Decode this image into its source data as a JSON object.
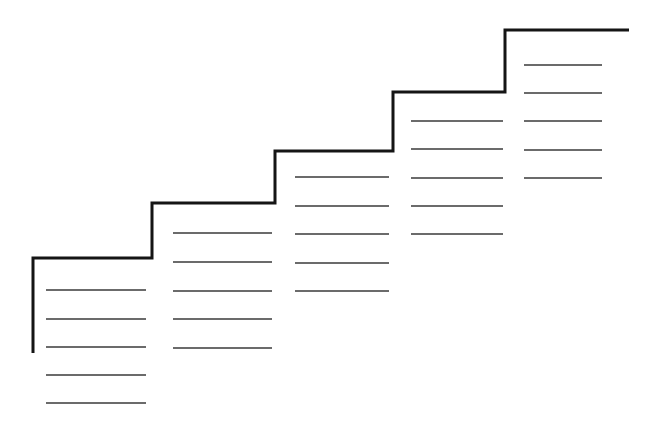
{
  "diagram": {
    "type": "staircase-worksheet",
    "colors": {
      "background": "#ffffff",
      "staircase": "#151515",
      "lines": "#3a3a3a"
    },
    "staircase_points": [
      [
        33,
        353
      ],
      [
        33,
        258
      ],
      [
        152,
        258
      ],
      [
        152,
        203
      ],
      [
        275,
        203
      ],
      [
        275,
        151
      ],
      [
        393,
        151
      ],
      [
        393,
        92
      ],
      [
        505,
        92
      ],
      [
        505,
        30
      ],
      [
        629,
        30
      ]
    ],
    "steps": [
      {
        "name": "step-1",
        "line_x1": 46,
        "line_x2": 146,
        "lines_y": [
          290,
          319,
          347,
          375,
          403
        ]
      },
      {
        "name": "step-2",
        "line_x1": 173,
        "line_x2": 272,
        "lines_y": [
          233,
          262,
          291,
          319,
          348
        ]
      },
      {
        "name": "step-3",
        "line_x1": 295,
        "line_x2": 389,
        "lines_y": [
          177,
          206,
          234,
          263,
          291
        ]
      },
      {
        "name": "step-4",
        "line_x1": 411,
        "line_x2": 503,
        "lines_y": [
          121,
          149,
          178,
          206,
          234
        ]
      },
      {
        "name": "step-5",
        "line_x1": 524,
        "line_x2": 602,
        "lines_y": [
          65,
          93,
          121,
          150,
          178
        ]
      }
    ]
  }
}
